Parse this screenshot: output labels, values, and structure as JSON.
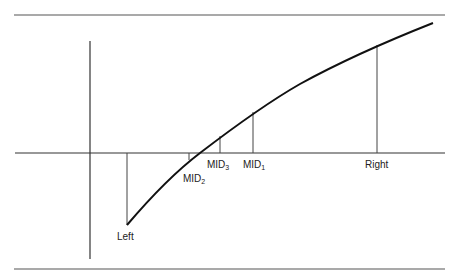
{
  "diagram": {
    "type": "bisection-method-illustration",
    "labels": {
      "left": "Left",
      "right": "Right",
      "mid1": {
        "base": "MID",
        "sub": "1"
      },
      "mid2": {
        "base": "MID",
        "sub": "2"
      },
      "mid3": {
        "base": "MID",
        "sub": "3"
      }
    },
    "colors": {
      "line": "#222222",
      "rule": "#555555",
      "background": "#ffffff"
    }
  }
}
